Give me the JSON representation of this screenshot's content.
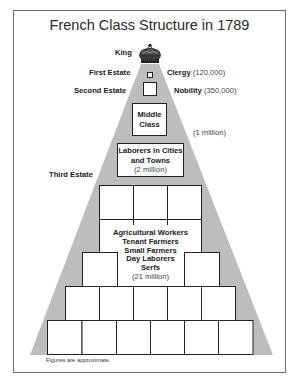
{
  "title": "French Class Structure in 1789",
  "colors": {
    "pyramid_fill": "#bdbdbd",
    "box_fill": "#ffffff",
    "box_border": "#222222",
    "frame_border": "#6a6a6a"
  },
  "labels": {
    "king": "King",
    "first_estate": "First Estate",
    "second_estate": "Second Estate",
    "third_estate": "Third Estate",
    "clergy": "Clergy",
    "clergy_count": "(120,000)",
    "nobility": "Nobility",
    "nobility_count": "(350,000)",
    "middle_class_line1": "Middle",
    "middle_class_line2": "Class",
    "middle_class_count": "(1 million)",
    "laborers_line1": "Laborers in Cities",
    "laborers_line2": "and Towns",
    "laborers_count": "(2 million)",
    "peasants": [
      "Agricultural Workers",
      "Tenant Farmers",
      "Small Farmers",
      "Day Laborers",
      "Serfs"
    ],
    "peasants_count": "(21 million)"
  },
  "footnote": "Figures are approximate.",
  "structure": [
    {
      "estate": "King",
      "group": "King",
      "population": null
    },
    {
      "estate": "First Estate",
      "group": "Clergy",
      "population": 120000
    },
    {
      "estate": "Second Estate",
      "group": "Nobility",
      "population": 350000
    },
    {
      "estate": "Third Estate",
      "group": "Middle Class",
      "population": 1000000
    },
    {
      "estate": "Third Estate",
      "group": "Laborers in Cities and Towns",
      "population": 2000000
    },
    {
      "estate": "Third Estate",
      "group": "Agricultural Workers, Tenant Farmers, Small Farmers, Day Laborers, Serfs",
      "population": 21000000
    }
  ]
}
